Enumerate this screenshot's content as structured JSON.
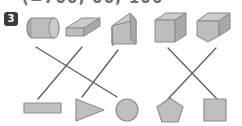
{
  "worksheet": {
    "header_partial_text": "(=700,  00,  100",
    "exercise_number": "3",
    "solids_row": [
      {
        "id": "cylinder",
        "name": "cylinder",
        "label": "cylinder",
        "cx": 45,
        "cy": 28
      },
      {
        "id": "rect-prism-flat",
        "name": "flat-rectangular-prism",
        "label": "rectangular prism",
        "cx": 78,
        "cy": 29
      },
      {
        "id": "triangular-prism",
        "name": "triangular-prism",
        "label": "triangular prism",
        "cx": 123,
        "cy": 27
      },
      {
        "id": "cube",
        "name": "cube",
        "label": "cube",
        "cx": 170,
        "cy": 27
      },
      {
        "id": "pentagonal-prism",
        "name": "pentagonal-prism",
        "label": "pentagonal prism",
        "cx": 214,
        "cy": 27
      }
    ],
    "flats_row": [
      {
        "id": "rectangle",
        "name": "rectangle",
        "label": "rectangle",
        "cx": 42,
        "cy": 109
      },
      {
        "id": "triangle",
        "name": "triangle",
        "label": "triangle",
        "cx": 88,
        "cy": 110
      },
      {
        "id": "circle",
        "name": "circle",
        "label": "circle",
        "cx": 127,
        "cy": 110
      },
      {
        "id": "pentagon",
        "name": "pentagon",
        "label": "pentagon",
        "cx": 170,
        "cy": 110
      },
      {
        "id": "square",
        "name": "square",
        "label": "square",
        "cx": 215,
        "cy": 110
      }
    ],
    "connectors": [
      {
        "id": "c1",
        "from": "cylinder",
        "to": "circle",
        "x1": 36,
        "y1": 47,
        "x2": 117,
        "y2": 97
      },
      {
        "id": "c2",
        "from": "rect-prism-flat",
        "to": "rectangle",
        "x1": 82,
        "y1": 47,
        "x2": 38,
        "y2": 99
      },
      {
        "id": "c3",
        "from": "triangular-prism",
        "to": "triangle",
        "x1": 118,
        "y1": 50,
        "x2": 82,
        "y2": 97
      },
      {
        "id": "c4",
        "from": "cube",
        "to": "square",
        "x1": 168,
        "y1": 48,
        "x2": 217,
        "y2": 99
      },
      {
        "id": "c5",
        "from": "pentagonal-prism",
        "to": "pentagon",
        "x1": 216,
        "y1": 48,
        "x2": 168,
        "y2": 99
      }
    ],
    "colors": {
      "shape_fill": "#bdbdbd",
      "shape_stroke": "#8a8a8a",
      "connector_stroke": "#5d5d5d",
      "badge_background": "#3a3a3a",
      "badge_text": "#ffffff",
      "page_background": "#ffffff"
    }
  }
}
